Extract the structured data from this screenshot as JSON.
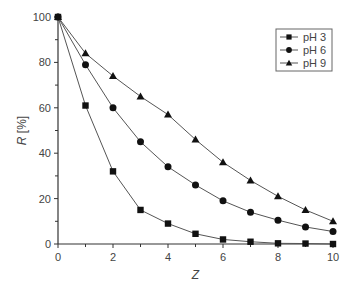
{
  "chart_data": {
    "type": "line",
    "title": "",
    "xlabel": "Z",
    "ylabel": "R [%]",
    "xlim": [
      0,
      10
    ],
    "ylim": [
      0,
      100
    ],
    "grid": false,
    "legend_position": "upper right",
    "x": [
      0,
      1,
      2,
      3,
      4,
      5,
      6,
      7,
      8,
      9,
      10
    ],
    "x_ticks": [
      0,
      2,
      4,
      6,
      8,
      10
    ],
    "y_ticks": [
      0,
      20,
      40,
      60,
      80,
      100
    ],
    "series": [
      {
        "name": "pH 3",
        "marker": "square",
        "values": [
          100,
          61,
          32,
          15,
          9,
          4.5,
          2,
          1,
          0.3,
          0.2,
          0
        ]
      },
      {
        "name": "pH 6",
        "marker": "circle",
        "values": [
          100,
          79,
          60,
          45,
          34,
          26,
          19,
          14,
          10.5,
          7.5,
          5.5
        ]
      },
      {
        "name": "pH 9",
        "marker": "triangle",
        "values": [
          100,
          84,
          74,
          65,
          57,
          46,
          36,
          28,
          21,
          15,
          10
        ]
      }
    ]
  },
  "colors": {
    "line": "#555555",
    "marker": "#111111",
    "axis": "#333333",
    "text": "#444444"
  }
}
